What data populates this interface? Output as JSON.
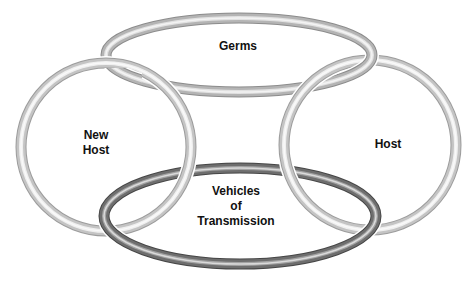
{
  "diagram": {
    "type": "chain-of-infection-rings",
    "rings": [
      {
        "id": "germs",
        "label_lines": [
          "Germs"
        ],
        "cx": 239,
        "cy": 55,
        "rx": 133,
        "ry": 37,
        "color": "#b4b4b4",
        "highlight": "#e6e6e6",
        "label_x": 238,
        "label_y": 46
      },
      {
        "id": "new-host",
        "label_lines": [
          "New",
          "Host"
        ],
        "cx": 106,
        "cy": 147,
        "rx": 85,
        "ry": 84,
        "color": "#c4c4c4",
        "highlight": "#f4f4f4",
        "label_x": 96,
        "label_y": 143
      },
      {
        "id": "host",
        "label_lines": [
          "Host"
        ],
        "cx": 370,
        "cy": 145,
        "rx": 86,
        "ry": 85,
        "color": "#c4c4c4",
        "highlight": "#f4f4f4",
        "label_x": 388,
        "label_y": 144
      },
      {
        "id": "vehicles",
        "label_lines": [
          "Vehicles",
          "of",
          "Transmission"
        ],
        "cx": 240,
        "cy": 216,
        "rx": 136,
        "ry": 48,
        "color": "#6e6e6e",
        "highlight": "#a8a8a8",
        "label_x": 236,
        "label_y": 205
      }
    ],
    "labels": {
      "germs": [
        "Germs"
      ],
      "new_host": [
        "New",
        "Host"
      ],
      "host": [
        "Host"
      ],
      "vehicles": [
        "Vehicles",
        "of",
        "Transmission"
      ]
    }
  }
}
